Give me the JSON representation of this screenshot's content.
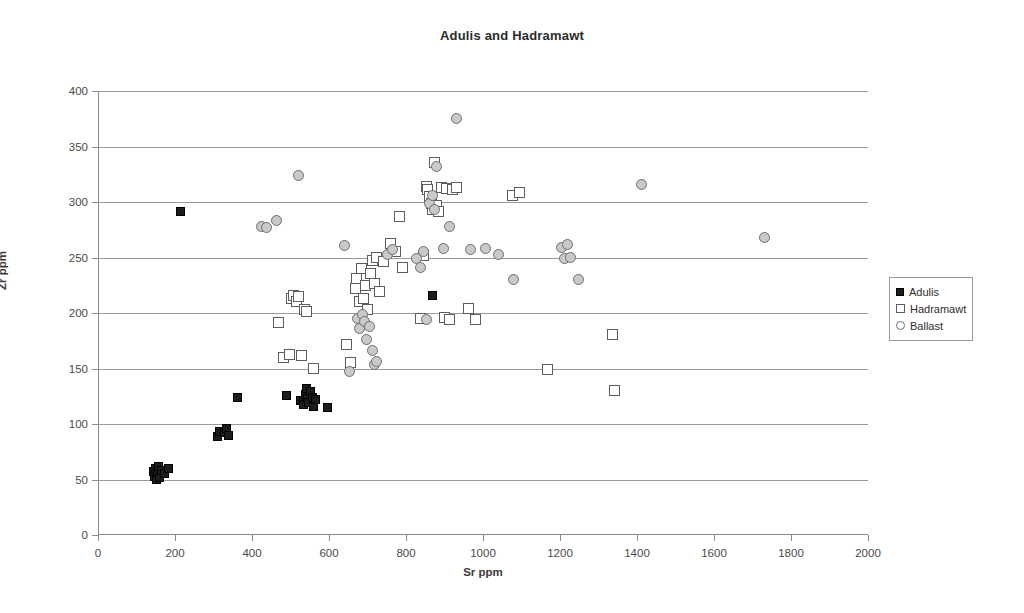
{
  "chart_data": {
    "type": "scatter",
    "title": "Adulis and Hadramawt",
    "xlabel": "Sr ppm",
    "ylabel": "Zr ppm",
    "xlim": [
      0,
      2000
    ],
    "ylim": [
      0,
      400
    ],
    "xticks": [
      0,
      200,
      400,
      600,
      800,
      1000,
      1200,
      1400,
      1600,
      1800,
      2000
    ],
    "yticks": [
      0,
      50,
      100,
      150,
      200,
      250,
      300,
      350,
      400
    ],
    "grid": "horizontal",
    "legend_position": "right",
    "series": [
      {
        "name": "Adulis",
        "marker": "filled-square",
        "color": "#1c1c1c",
        "points": [
          [
            143,
            57
          ],
          [
            147,
            53
          ],
          [
            150,
            60
          ],
          [
            152,
            50
          ],
          [
            155,
            56
          ],
          [
            158,
            62
          ],
          [
            160,
            52
          ],
          [
            164,
            58
          ],
          [
            172,
            55
          ],
          [
            182,
            60
          ],
          [
            215,
            291
          ],
          [
            310,
            89
          ],
          [
            316,
            93
          ],
          [
            328,
            92
          ],
          [
            334,
            96
          ],
          [
            338,
            90
          ],
          [
            362,
            124
          ],
          [
            489,
            126
          ],
          [
            527,
            121
          ],
          [
            534,
            118
          ],
          [
            538,
            127
          ],
          [
            541,
            132
          ],
          [
            545,
            123
          ],
          [
            548,
            119
          ],
          [
            552,
            129
          ],
          [
            556,
            124
          ],
          [
            560,
            116
          ],
          [
            566,
            122
          ],
          [
            597,
            115
          ],
          [
            868,
            216
          ]
        ]
      },
      {
        "name": "Hadramawt",
        "marker": "open-square",
        "color": "#ffffff",
        "points": [
          [
            470,
            191
          ],
          [
            481,
            160
          ],
          [
            497,
            163
          ],
          [
            502,
            213
          ],
          [
            508,
            216
          ],
          [
            516,
            210
          ],
          [
            522,
            215
          ],
          [
            528,
            162
          ],
          [
            536,
            203
          ],
          [
            541,
            201
          ],
          [
            560,
            150
          ],
          [
            645,
            172
          ],
          [
            655,
            155
          ],
          [
            668,
            222
          ],
          [
            672,
            231
          ],
          [
            678,
            210
          ],
          [
            684,
            240
          ],
          [
            690,
            213
          ],
          [
            694,
            225
          ],
          [
            700,
            203
          ],
          [
            707,
            236
          ],
          [
            712,
            247
          ],
          [
            718,
            227
          ],
          [
            724,
            250
          ],
          [
            730,
            219
          ],
          [
            742,
            246
          ],
          [
            760,
            263
          ],
          [
            772,
            255
          ],
          [
            784,
            287
          ],
          [
            792,
            241
          ],
          [
            838,
            195
          ],
          [
            845,
            252
          ],
          [
            852,
            314
          ],
          [
            857,
            311
          ],
          [
            862,
            305
          ],
          [
            866,
            299
          ],
          [
            870,
            293
          ],
          [
            874,
            336
          ],
          [
            880,
            297
          ],
          [
            884,
            291
          ],
          [
            892,
            313
          ],
          [
            900,
            196
          ],
          [
            906,
            312
          ],
          [
            914,
            194
          ],
          [
            922,
            311
          ],
          [
            930,
            313
          ],
          [
            962,
            204
          ],
          [
            980,
            194
          ],
          [
            1076,
            306
          ],
          [
            1094,
            309
          ],
          [
            1168,
            149
          ],
          [
            1336,
            181
          ],
          [
            1342,
            130
          ]
        ]
      },
      {
        "name": "Ballast",
        "marker": "open-circle",
        "color": "#c9c9c9",
        "points": [
          [
            424,
            278
          ],
          [
            438,
            277
          ],
          [
            464,
            283
          ],
          [
            520,
            324
          ],
          [
            640,
            261
          ],
          [
            654,
            147
          ],
          [
            674,
            195
          ],
          [
            680,
            186
          ],
          [
            686,
            199
          ],
          [
            692,
            192
          ],
          [
            698,
            176
          ],
          [
            704,
            188
          ],
          [
            712,
            166
          ],
          [
            718,
            154
          ],
          [
            724,
            156
          ],
          [
            752,
            253
          ],
          [
            766,
            257
          ],
          [
            826,
            249
          ],
          [
            838,
            241
          ],
          [
            846,
            255
          ],
          [
            852,
            194
          ],
          [
            862,
            299
          ],
          [
            868,
            306
          ],
          [
            874,
            293
          ],
          [
            880,
            332
          ],
          [
            898,
            258
          ],
          [
            914,
            278
          ],
          [
            930,
            375
          ],
          [
            968,
            257
          ],
          [
            1006,
            258
          ],
          [
            1040,
            253
          ],
          [
            1080,
            230
          ],
          [
            1204,
            259
          ],
          [
            1212,
            249
          ],
          [
            1220,
            262
          ],
          [
            1228,
            250
          ],
          [
            1248,
            230
          ],
          [
            1412,
            316
          ],
          [
            1730,
            268
          ]
        ]
      }
    ]
  },
  "legend": {
    "items": [
      {
        "label": "Adulis",
        "marker": "filled-square"
      },
      {
        "label": "Hadramawt",
        "marker": "open-square"
      },
      {
        "label": "Ballast",
        "marker": "open-circle"
      }
    ]
  }
}
